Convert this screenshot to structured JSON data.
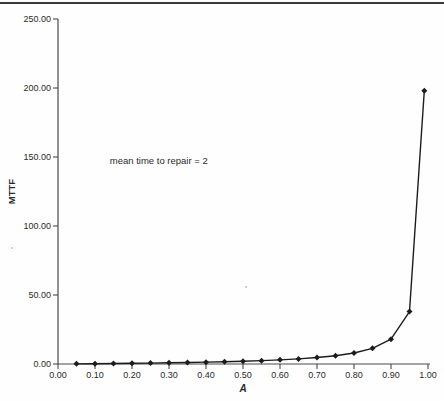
{
  "page": {
    "background": "#fefefe"
  },
  "chart_data": {
    "type": "line",
    "title": "",
    "xlabel": "A",
    "ylabel": "MTTF",
    "x": [
      0.05,
      0.1,
      0.15,
      0.2,
      0.25,
      0.3,
      0.35,
      0.4,
      0.45,
      0.5,
      0.55,
      0.6,
      0.65,
      0.7,
      0.75,
      0.8,
      0.85,
      0.9,
      0.95,
      0.99
    ],
    "series": [
      {
        "name": "MTTF",
        "values": [
          0.11,
          0.22,
          0.35,
          0.5,
          0.67,
          0.86,
          1.08,
          1.33,
          1.64,
          2.0,
          2.44,
          3.0,
          3.71,
          4.67,
          6.0,
          8.0,
          11.33,
          18.0,
          38.0,
          198.0
        ]
      }
    ],
    "xlim": [
      0,
      1
    ],
    "ylim": [
      0,
      250
    ],
    "x_ticks": [
      "0.00",
      "0.10",
      "0.20",
      "0.30",
      "0.40",
      "0.50",
      "0.60",
      "0.70",
      "0.80",
      "0.90",
      "1.00"
    ],
    "y_ticks": [
      "0.00",
      "50.00",
      "100.00",
      "150.00",
      "200.00",
      "250.00"
    ],
    "grid": false,
    "legend": "none",
    "marker": "diamond",
    "annotation": {
      "text": "mean time to repair = 2",
      "x": 0.14,
      "y": 147
    },
    "colors": {
      "series": "#1c1c1c",
      "axis": "#4a4a4a",
      "text": "#2b2b2b",
      "rule": "#3a3a3a",
      "speck": "#bcbcbc"
    },
    "artifacts": [
      {
        "x": 12,
        "y": 248
      },
      {
        "x": 246,
        "y": 287
      }
    ]
  }
}
